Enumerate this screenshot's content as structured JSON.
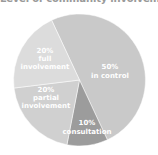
{
  "chart_data": {
    "type": "pie",
    "title": "Level of community involvement",
    "categories": [
      "in control",
      "consultation",
      "partial involvement",
      "full involvement"
    ],
    "values": [
      50,
      10,
      20,
      20
    ],
    "unit": "%",
    "labels": [
      {
        "pct": "50%",
        "lines": [
          "in control"
        ]
      },
      {
        "pct": "10%",
        "lines": [
          "consultation"
        ]
      },
      {
        "pct": "20%",
        "lines": [
          "partial",
          "involvement"
        ]
      },
      {
        "pct": "20%",
        "lines": [
          "full",
          "involvement"
        ]
      }
    ],
    "colors": [
      "#c9c9c9",
      "#9c9c9c",
      "#d0d0d0",
      "#dcdcdc"
    ],
    "legend": "none (labels inside slices)",
    "start_angle_deg": -25
  }
}
